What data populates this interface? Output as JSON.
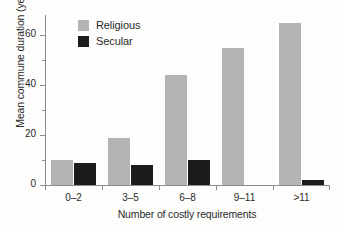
{
  "chart_data": {
    "type": "bar",
    "title": "",
    "xlabel": "Number of costly requirements",
    "ylabel": "Mean commune duration (years)",
    "categories": [
      "0–2",
      "3–5",
      "6–8",
      "9–11",
      ">11"
    ],
    "series": [
      {
        "name": "Religious",
        "color": "#b4b4b4",
        "values": [
          10,
          19,
          44,
          55,
          65
        ]
      },
      {
        "name": "Secular",
        "color": "#1c1c1c",
        "values": [
          9,
          8,
          10,
          0,
          2
        ]
      }
    ],
    "ylim": [
      0,
      68
    ],
    "ytick_labels": [
      "0",
      "20",
      "40",
      "60"
    ],
    "ytick_values": [
      0,
      20,
      40,
      60
    ],
    "yminor_values": [
      10,
      30,
      50
    ],
    "grid": false,
    "legend_position": "upper-left-inside"
  },
  "legend": {
    "items": [
      {
        "label": "Religious",
        "swatch": "religious"
      },
      {
        "label": "Secular",
        "swatch": "secular"
      }
    ]
  }
}
